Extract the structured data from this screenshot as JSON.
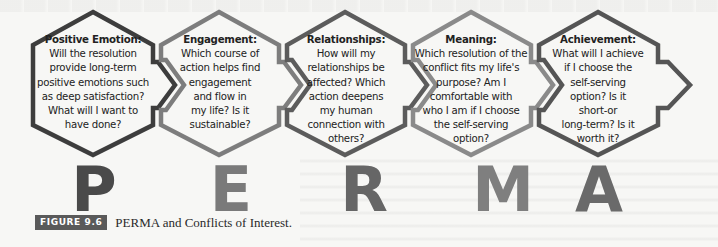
{
  "figure": {
    "badge": "FIGURE 9.6",
    "caption": "PERMA and Conflicts of Interest."
  },
  "hexagons": [
    {
      "title": "Positive Emotion:",
      "body": "Will the resolution\nprovide long-term\npositive emotions such\nas deep satisfaction?\nWhat will I want to\nhave done?",
      "letter": "P",
      "outline_color": "#3d3d3d",
      "letter_color": "#4a4a4a"
    },
    {
      "title": "Engagement:",
      "body": "Which course of\naction helps find\nengagement\nand flow in\nmy life? Is it\nsustainable?",
      "letter": "E",
      "outline_color": "#7d7d7d",
      "letter_color": "#7a7a7a"
    },
    {
      "title": "Relationships:",
      "body": "How will my\nrelationships be\naffected? Which\naction deepens\nmy human\nconnection with\nothers?",
      "letter": "R",
      "outline_color": "#5c5c5c",
      "letter_color": "#666666"
    },
    {
      "title": "Meaning:",
      "body": "Which resolution of the\nconflict fits my life's\npurpose? Am I\ncomfortable with\nwho I am if I choose\nthe self-serving\noption?",
      "letter": "M",
      "outline_color": "#8a8a8a",
      "letter_color": "#7f7f7f"
    },
    {
      "title": "Achievement:",
      "body": "What will I achieve\nif I choose the\nself-serving\noption? Is it\nshort-or\nlong-term? Is it\nworth it?",
      "letter": "A",
      "outline_color": "#555555",
      "letter_color": "#6a6a6a"
    }
  ]
}
